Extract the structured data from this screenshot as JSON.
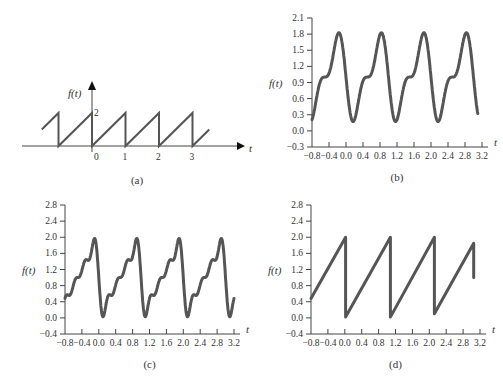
{
  "chart_data": [
    {
      "id": "a",
      "type": "line",
      "title": "",
      "caption": "(a)",
      "xlabel": "t",
      "ylabel": "f(t)",
      "description": "Periodic sawtooth: rises linearly from 0 to 2 over each unit period, drops vertically to 0 at integer t",
      "x_tick_labels": [
        "0",
        "1",
        "2",
        "3"
      ],
      "y_tick_labels": [
        "2"
      ],
      "period": 1,
      "amplitude": 2,
      "x_range": [
        -1.5,
        3.5
      ],
      "grid": false
    },
    {
      "id": "b",
      "type": "line",
      "caption": "(b)",
      "xlabel": "t",
      "ylabel": "f(t)",
      "description": "Fourier series approximation of sawtooth with 2 harmonics",
      "harmonics": 2,
      "x_ticks": [
        -0.8,
        -0.4,
        0.0,
        0.4,
        0.8,
        1.2,
        1.6,
        2.0,
        2.4,
        2.8,
        3.2
      ],
      "x_tick_labels": [
        "−0.8",
        "−0.4",
        "0.0",
        "0.4",
        "0.8",
        "1.2",
        "1.6",
        "2.0",
        "2.4",
        "2.8",
        "3.2"
      ],
      "y_ticks": [
        -0.3,
        0.0,
        0.3,
        0.6,
        0.9,
        1.2,
        1.5,
        1.8,
        2.1
      ],
      "y_tick_labels": [
        "−0.3",
        "0.0",
        "0.3",
        "0.6",
        "0.9",
        "1.2",
        "1.5",
        "1.8",
        "2.1"
      ],
      "xlim": [
        -0.8,
        3.2
      ],
      "ylim": [
        -0.3,
        2.1
      ],
      "t_range": [
        -0.8,
        3.1
      ],
      "peak": 1.85,
      "trough": 0.2,
      "grid": false
    },
    {
      "id": "c",
      "type": "line",
      "caption": "(c)",
      "xlabel": "t",
      "ylabel": "f(t)",
      "description": "Fourier series approximation of sawtooth with 4 harmonics",
      "harmonics": 4,
      "x_ticks": [
        -0.8,
        -0.4,
        0.0,
        0.4,
        0.8,
        1.2,
        1.6,
        2.0,
        2.4,
        2.8,
        3.2
      ],
      "x_tick_labels": [
        "−0.8",
        "−0.4",
        "0.0",
        "0.4",
        "0.8",
        "1.2",
        "1.6",
        "2.0",
        "2.4",
        "2.8",
        "3.2"
      ],
      "y_ticks": [
        -0.4,
        0.0,
        0.4,
        0.8,
        1.2,
        1.6,
        2.0,
        2.4,
        2.8
      ],
      "y_tick_labels": [
        "−0.4",
        "0.0",
        "0.4",
        "0.8",
        "1.2",
        "1.6",
        "2.0",
        "2.4",
        "2.8"
      ],
      "xlim": [
        -0.8,
        3.2
      ],
      "ylim": [
        -0.4,
        2.8
      ],
      "t_range": [
        -0.8,
        3.2
      ],
      "peak": 2.0,
      "trough": 0.0,
      "grid": false
    },
    {
      "id": "d",
      "type": "line",
      "caption": "(d)",
      "xlabel": "t",
      "ylabel": "f(t)",
      "description": "Sawtooth with period ~1.05 rising from ~0 to ~2, truncated at t≈3.05 (drop to ~1.0)",
      "x_ticks": [
        -0.8,
        -0.4,
        0.0,
        0.4,
        0.8,
        1.2,
        1.6,
        2.0,
        2.4,
        2.8,
        3.2
      ],
      "x_tick_labels": [
        "−0.8",
        "−0.4",
        "0.0",
        "0.4",
        "0.8",
        "1.2",
        "1.6",
        "2.0",
        "2.4",
        "2.8",
        "3.2"
      ],
      "y_ticks": [
        -0.4,
        0.0,
        0.4,
        0.8,
        1.2,
        1.6,
        2.0,
        2.4,
        2.8
      ],
      "y_tick_labels": [
        "−0.4",
        "0.0",
        "0.4",
        "0.8",
        "1.2",
        "1.6",
        "2.0",
        "2.4",
        "2.8"
      ],
      "xlim": [
        -0.8,
        3.2
      ],
      "ylim": [
        -0.4,
        2.8
      ],
      "points": [
        [
          -0.8,
          0.48
        ],
        [
          0.02,
          2.0
        ],
        [
          0.02,
          0.02
        ],
        [
          1.08,
          2.0
        ],
        [
          1.08,
          0.02
        ],
        [
          2.12,
          2.0
        ],
        [
          2.12,
          0.1
        ],
        [
          3.05,
          1.85
        ],
        [
          3.05,
          1.0
        ]
      ],
      "grid": false
    }
  ],
  "layout": {
    "a": {
      "origin_x": 92,
      "axis_y": 146,
      "unit_x": 33.5,
      "unit_y": 16.5,
      "x_start": 40,
      "x_end": 210,
      "arrow_x": 245,
      "arrow_top": 83
    },
    "b": {
      "left": 312,
      "right": 482,
      "top": 18,
      "bottom": 147
    },
    "c": {
      "left": 65,
      "right": 234,
      "top": 205,
      "bottom": 334
    },
    "d": {
      "left": 311,
      "right": 480,
      "top": 205,
      "bottom": 334
    }
  },
  "colors": {
    "curve": "#555555",
    "axis": "#444444",
    "text": "#333333"
  }
}
